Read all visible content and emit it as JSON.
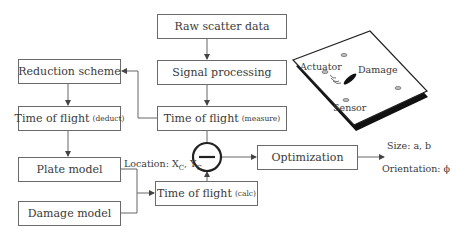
{
  "nodes": {
    "raw_scatter": {
      "label": "Raw scatter data"
    },
    "signal_processing": {
      "label": "Signal processing"
    },
    "tof_measure": {
      "label": "Time of flight",
      "qualifier": "(measure)"
    },
    "reduction_scheme": {
      "label": "Reduction scheme"
    },
    "tof_deduct": {
      "label": "Time of flight",
      "qualifier": "(deduct)"
    },
    "plate_model": {
      "label": "Plate model"
    },
    "damage_model": {
      "label": "Damage model"
    },
    "tof_calc": {
      "label": "Time of flight",
      "qualifier": "(calc)"
    },
    "optimization": {
      "label": "Optimization"
    },
    "subtract": {
      "symbol": "−"
    }
  },
  "labels": {
    "location": {
      "prefix": "Location: X",
      "sub1": "C",
      "mid": ", Y",
      "sub2": "C"
    },
    "size": "Size: a, b",
    "orientation": "Orientation: ϕ"
  },
  "plate_illustration": {
    "actuator": "Actuator",
    "damage": "Damage",
    "sensor": "Sensor"
  }
}
